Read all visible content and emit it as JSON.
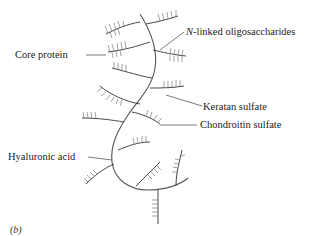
{
  "figure": {
    "panel_label": "(b)",
    "labels": {
      "core_protein": "Core protein",
      "n_linked_prefix": "N",
      "n_linked_rest": "-linked oligosaccharides",
      "keratan_sulfate": "Keratan sulfate",
      "chondroitin_sulfate": "Chondroitin sulfate",
      "hyaluronic_acid": "Hyaluronic acid"
    },
    "colors": {
      "background": "#ffffff",
      "line": "#444444",
      "text": "#222222"
    }
  }
}
